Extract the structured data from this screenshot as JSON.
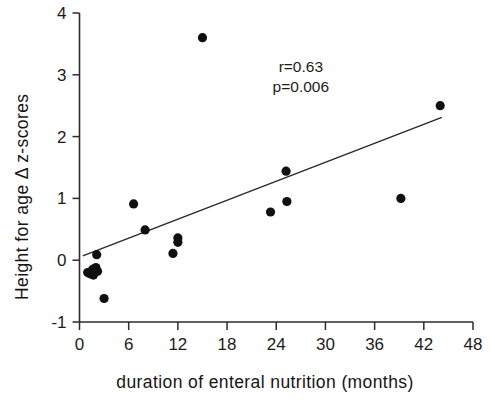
{
  "chart_data": {
    "type": "scatter",
    "title": "",
    "xlabel": "duration of enteral nutrition (months)",
    "ylabel": "Height for age Δ z-scores",
    "xlim": [
      0,
      48
    ],
    "ylim": [
      -1,
      4
    ],
    "xticks": [
      0,
      6,
      12,
      18,
      24,
      30,
      36,
      42,
      48
    ],
    "yticks": [
      -1,
      0,
      1,
      2,
      3,
      4
    ],
    "xtick_labels": [
      "0",
      "6",
      "12",
      "18",
      "24",
      "30",
      "36",
      "42",
      "48"
    ],
    "ytick_labels": [
      "-1",
      "0",
      "1",
      "2",
      "3",
      "4"
    ],
    "grid": false,
    "legend": null,
    "annotations": [
      {
        "name": "correlation-coefficient",
        "text": "r=0.63",
        "x": 27.0,
        "y": 3.05
      },
      {
        "name": "p-value",
        "text": "p=0.006",
        "x": 27.0,
        "y": 2.72
      }
    ],
    "points": [
      {
        "x": 1.0,
        "y": -0.2
      },
      {
        "x": 1.3,
        "y": -0.22
      },
      {
        "x": 1.6,
        "y": -0.15
      },
      {
        "x": 1.7,
        "y": -0.24
      },
      {
        "x": 2.0,
        "y": -0.12
      },
      {
        "x": 2.1,
        "y": 0.09
      },
      {
        "x": 2.2,
        "y": -0.18
      },
      {
        "x": 3.0,
        "y": -0.62
      },
      {
        "x": 6.6,
        "y": 0.91
      },
      {
        "x": 8.0,
        "y": 0.49
      },
      {
        "x": 11.4,
        "y": 0.11
      },
      {
        "x": 12.0,
        "y": 0.36
      },
      {
        "x": 12.0,
        "y": 0.29
      },
      {
        "x": 15.0,
        "y": 3.6
      },
      {
        "x": 23.3,
        "y": 0.78
      },
      {
        "x": 25.2,
        "y": 1.44
      },
      {
        "x": 25.3,
        "y": 0.95
      },
      {
        "x": 39.2,
        "y": 1.0
      },
      {
        "x": 44.0,
        "y": 2.5
      }
    ],
    "fit_line": {
      "x0": 0.4,
      "y0": 0.07,
      "x1": 44.2,
      "y1": 2.31
    }
  }
}
